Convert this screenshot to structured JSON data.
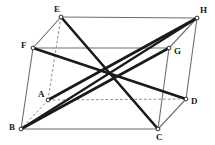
{
  "figure": {
    "type": "geometry-diagram",
    "shape_name": "parallelepiped",
    "canvas": {
      "width": 215,
      "height": 145
    },
    "colors": {
      "background": "#ffffff",
      "visible_edge": "#6e6e6e",
      "hidden_edge": "#8a8a8a",
      "diagonal": "#1a1a1a",
      "vertex_dot_stroke": "#1a1a1a",
      "vertex_dot_fill": "#ffffff",
      "label_text": "#1a1a1a"
    },
    "vertices": [
      {
        "id": "A",
        "label": "A",
        "x": 48,
        "y": 100,
        "label_x": 38,
        "label_y": 90,
        "hidden": true
      },
      {
        "id": "B",
        "label": "B",
        "x": 21,
        "y": 129,
        "label_x": 9,
        "label_y": 123,
        "hidden": false
      },
      {
        "id": "C",
        "label": "C",
        "x": 158,
        "y": 129,
        "label_x": 156,
        "label_y": 133,
        "hidden": false
      },
      {
        "id": "D",
        "label": "D",
        "x": 186,
        "y": 99,
        "label_x": 191,
        "label_y": 97,
        "hidden": false
      },
      {
        "id": "E",
        "label": "E",
        "x": 61,
        "y": 17,
        "label_x": 54,
        "label_y": 5,
        "hidden": false
      },
      {
        "id": "F",
        "label": "F",
        "x": 33,
        "y": 48,
        "label_x": 21,
        "label_y": 41,
        "hidden": false
      },
      {
        "id": "G",
        "label": "G",
        "x": 169,
        "y": 48,
        "label_x": 174,
        "label_y": 47,
        "hidden": false
      },
      {
        "id": "H",
        "label": "H",
        "x": 197,
        "y": 18,
        "label_x": 200,
        "label_y": 6,
        "hidden": false
      }
    ],
    "edges": [
      {
        "id": "edge-EH",
        "from": "E",
        "to": "H",
        "style": "solid",
        "weight": "thin",
        "hidden": false
      },
      {
        "id": "edge-FG",
        "from": "F",
        "to": "G",
        "style": "solid",
        "weight": "thin",
        "hidden": false
      },
      {
        "id": "edge-EF",
        "from": "E",
        "to": "F",
        "style": "solid",
        "weight": "thin",
        "hidden": false
      },
      {
        "id": "edge-HG",
        "from": "H",
        "to": "G",
        "style": "solid",
        "weight": "thin",
        "hidden": false
      },
      {
        "id": "edge-BC",
        "from": "B",
        "to": "C",
        "style": "solid",
        "weight": "thin",
        "hidden": false
      },
      {
        "id": "edge-CD",
        "from": "C",
        "to": "D",
        "style": "solid",
        "weight": "thin",
        "hidden": false
      },
      {
        "id": "edge-FB",
        "from": "F",
        "to": "B",
        "style": "solid",
        "weight": "thin",
        "hidden": false
      },
      {
        "id": "edge-GC",
        "from": "G",
        "to": "C",
        "style": "solid",
        "weight": "thin",
        "hidden": false
      },
      {
        "id": "edge-HD",
        "from": "H",
        "to": "D",
        "style": "solid",
        "weight": "thin",
        "hidden": false
      },
      {
        "id": "edge-EA",
        "from": "E",
        "to": "A",
        "style": "dashed",
        "weight": "thin",
        "hidden": true
      },
      {
        "id": "edge-AB",
        "from": "A",
        "to": "B",
        "style": "dashed",
        "weight": "thin",
        "hidden": true
      },
      {
        "id": "edge-AD",
        "from": "A",
        "to": "D",
        "style": "dashed",
        "weight": "thin",
        "hidden": true
      }
    ],
    "diagonals": [
      {
        "id": "diagonal-EC",
        "from": "E",
        "to": "C",
        "style": "solid",
        "weight": "thick"
      },
      {
        "id": "diagonal-FD",
        "from": "F",
        "to": "D",
        "style": "solid",
        "weight": "thick"
      },
      {
        "id": "diagonal-AH",
        "from": "A",
        "to": "H",
        "style": "solid",
        "weight": "thick"
      },
      {
        "id": "diagonal-BG",
        "from": "B",
        "to": "G",
        "style": "solid",
        "weight": "thick"
      }
    ],
    "center": {
      "id": "center-point",
      "x": 109,
      "y": 74
    }
  }
}
